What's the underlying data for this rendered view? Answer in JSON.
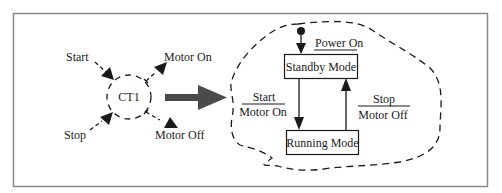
{
  "diagram": {
    "type": "state-machine-abstraction",
    "colors": {
      "frame": "#8a8a8a",
      "ink": "#1a1a1a",
      "transform_arrow": "#4a4a4a",
      "background": "#ffffff"
    },
    "left": {
      "component": {
        "label": "CT1",
        "shape": "dashed-circle"
      },
      "inputs": [
        {
          "label": "Start",
          "direction": "in"
        },
        {
          "label": "Stop",
          "direction": "in"
        }
      ],
      "outputs": [
        {
          "label": "Motor On",
          "direction": "out"
        },
        {
          "label": "Motor Off",
          "direction": "out"
        }
      ]
    },
    "transform_arrow": {
      "icon": "thick-right-arrow-icon"
    },
    "right": {
      "container_shape": "dashed-cloud",
      "initial_state": {
        "icon": "filled-dot-icon"
      },
      "initial_transition": {
        "event": "Power On"
      },
      "states": [
        {
          "id": "standby",
          "label": "Standby Mode"
        },
        {
          "id": "running",
          "label": "Running Mode"
        }
      ],
      "transitions": [
        {
          "from": "standby",
          "to": "running",
          "event": "Start",
          "action": "Motor On"
        },
        {
          "from": "running",
          "to": "standby",
          "event": "Stop",
          "action": "Motor Off"
        }
      ]
    }
  }
}
